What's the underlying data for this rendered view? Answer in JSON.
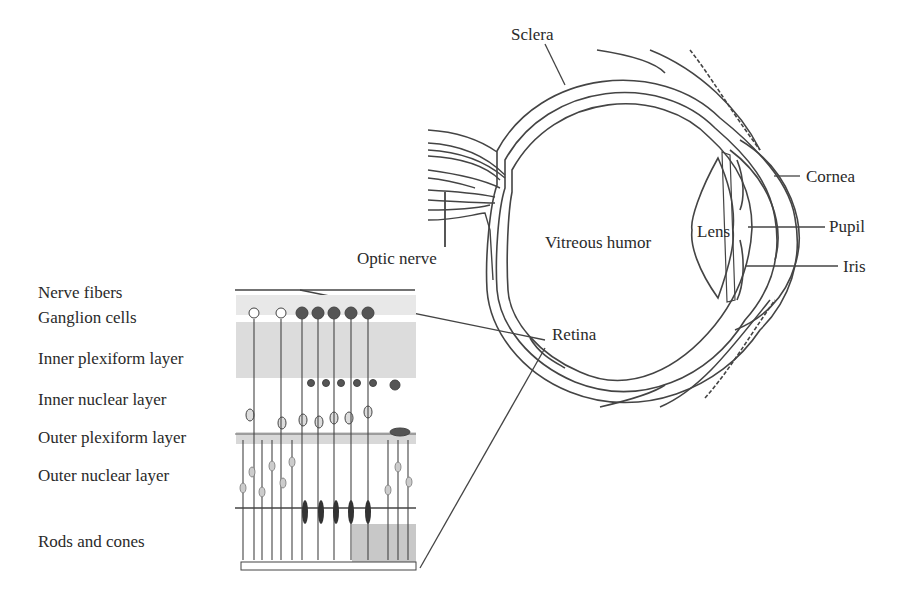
{
  "eye_labels": {
    "sclera": "Sclera",
    "cornea": "Cornea",
    "pupil": "Pupil",
    "iris": "Iris",
    "lens": "Lens",
    "vitreous_humor": "Vitreous humor",
    "optic_nerve": "Optic nerve",
    "retina": "Retina"
  },
  "retina_layers": [
    {
      "label": "Nerve fibers"
    },
    {
      "label": "Ganglion cells"
    },
    {
      "label": "Inner plexiform layer"
    },
    {
      "label": "Inner nuclear layer"
    },
    {
      "label": "Outer plexiform layer"
    },
    {
      "label": "Outer nuclear layer"
    },
    {
      "label": "Rods and cones"
    }
  ]
}
